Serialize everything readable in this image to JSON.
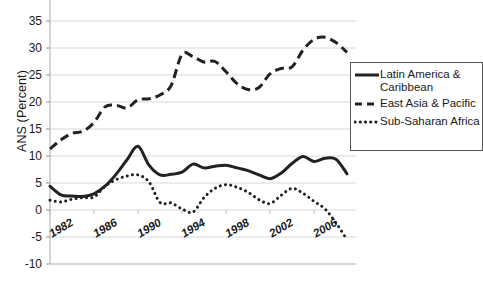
{
  "chart_data": {
    "type": "line",
    "title": "",
    "xlabel": "",
    "ylabel": "ANS (Percent)",
    "xlim": [
      1982,
      2009
    ],
    "ylim": [
      -10,
      35
    ],
    "grid": true,
    "legend_position": "right",
    "x": [
      1982,
      1983,
      1984,
      1985,
      1986,
      1987,
      1988,
      1989,
      1990,
      1991,
      1992,
      1993,
      1994,
      1995,
      1996,
      1997,
      1998,
      1999,
      2000,
      2001,
      2002,
      2003,
      2004,
      2005,
      2006,
      2007,
      2008,
      2009
    ],
    "xticks": [
      "1982",
      "1986",
      "1990",
      "1994",
      "1998",
      "2002",
      "2006"
    ],
    "xtick_values": [
      1982,
      1986,
      1990,
      1994,
      1998,
      2002,
      2006
    ],
    "yticks": [
      "35",
      "30",
      "25",
      "20",
      "15",
      "10",
      "5",
      "0",
      "-5",
      "-10"
    ],
    "ytick_values": [
      35,
      30,
      25,
      20,
      15,
      10,
      5,
      0,
      -5,
      -10
    ],
    "series": [
      {
        "name": "Latin America & Caribbean",
        "style": "solid",
        "color": "#222222",
        "values": [
          4.4,
          2.8,
          2.6,
          2.5,
          3.0,
          4.4,
          6.6,
          9.3,
          11.8,
          8.3,
          6.5,
          6.6,
          7.0,
          8.5,
          7.8,
          8.1,
          8.3,
          7.8,
          7.3,
          6.5,
          5.8,
          6.8,
          8.6,
          9.9,
          9.0,
          9.6,
          9.4,
          6.7
        ]
      },
      {
        "name": "East Asia & Pacific",
        "style": "dashed",
        "color": "#222222",
        "values": [
          11.3,
          13.0,
          14.2,
          14.6,
          16.2,
          19.1,
          19.4,
          18.9,
          20.4,
          20.6,
          21.3,
          23.0,
          28.8,
          28.4,
          27.4,
          27.5,
          25.6,
          23.4,
          22.3,
          22.7,
          25.2,
          26.2,
          26.5,
          29.6,
          31.6,
          32.0,
          31.0,
          29.2
        ]
      },
      {
        "name": "Sub-Saharan Africa",
        "style": "dotted",
        "color": "#222222",
        "values": [
          1.8,
          1.5,
          2.0,
          2.3,
          2.4,
          4.4,
          5.6,
          6.3,
          6.5,
          5.2,
          1.4,
          1.3,
          0.2,
          -0.4,
          2.3,
          4.0,
          4.7,
          4.2,
          3.3,
          1.9,
          1.2,
          2.7,
          4.0,
          3.1,
          1.6,
          0.2,
          -2.4,
          -5.5
        ]
      }
    ]
  },
  "legend": {
    "items": [
      {
        "label_line1": "Latin America &",
        "label_line2": "Caribbean",
        "style": "solid"
      },
      {
        "label_line1": "East Asia & Pacific",
        "label_line2": "",
        "style": "dashed"
      },
      {
        "label_line1": "Sub-Saharan Africa",
        "label_line2": "",
        "style": "dotted"
      }
    ]
  }
}
